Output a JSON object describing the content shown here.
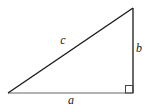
{
  "figure": {
    "type": "right-triangle-diagram",
    "labels": {
      "hypotenuse": "c",
      "vertical_side": "b",
      "horizontal_side": "a"
    },
    "colors": {
      "edge": "#1a1a1a",
      "base_edge": "#666666",
      "right_angle_marker": "#444444",
      "background": "#ffffff",
      "label_text": "#1a1a1a"
    }
  }
}
